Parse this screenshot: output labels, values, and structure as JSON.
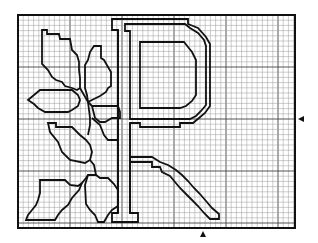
{
  "figure": {
    "type": "cross-stitch-chart",
    "grid": {
      "x": 18,
      "y": 15,
      "width": 277,
      "height": 213,
      "cell": 5.2,
      "color": "#9a9a9a",
      "major_color": "#444444",
      "major_every": 10
    },
    "colors": {
      "line": "#111111",
      "background": "#ffffff"
    },
    "center_markers": {
      "right": {
        "x": 298,
        "y": 119
      },
      "bottom": {
        "x": 203,
        "y": 231
      }
    },
    "letter_p": {
      "outer": "M112,26 L112,19 L188,19 L188,24 L198,28 L206,37 L210,44 L210,106 L205,113 L199,118 L193,123 L180,123 L180,127 L140,127 L140,123 L130,123 L130,213 L138,213 L138,222 L112,222 L112,213 L118,213 L118,30 L112,30 Z",
      "inner_stroke": "M118,30 L118,213 M130,123 L130,213",
      "bowl_outer": "M125,24 L185,24 L190,28 L198,33 L204,40 L206,46 L206,105 L201,111 L196,116 L190,119 L130,119 L130,31 L125,31 Z",
      "bowl_inner": "M140,42 L184,42 L188,47 L192,52 L196,60 L196,95 L192,101 L186,106 L180,108 L140,108 Z"
    },
    "leg_tail": "M130,162 L152,162 L152,167 L160,167 L162,172 L170,176 L175,182 L180,188 L186,194 L192,200 L198,206 L204,213 L210,219 L219,219 L219,214 L212,208 L206,201 L200,194 L194,188 L188,181 L182,175 L176,170 L168,165 L160,162 L152,157 L130,157 Z",
    "leaves": [
      "M42,30 L47,30 L47,34 L59,34 L60,39 L70,39 L72,50 L77,55 L79,62 L79,70 L80,78 L80,88 L77,90 L72,88 L65,86 L62,82 L56,80 L52,77 L48,70 L42,64 Z",
      "M94,46 L101,46 L101,58 L104,60 L108,67 L111,72 L111,86 L108,88 L106,92 L100,96 L96,98 L88,102 L87,95 L85,88 L85,65 L88,60 L90,52 Z",
      "M40,90 L72,90 L78,95 L80,100 L78,106 L72,110 L68,112 L45,112 L38,108 L34,104 L28,100 L34,95 Z",
      "M92,106 L118,106 L120,112 L120,118 L112,118 L105,122 L100,122 L95,118 Z",
      "M48,123 L56,123 L56,127 L72,127 L80,135 L86,140 L90,145 L92,152 L90,160 L85,163 L70,160 L62,152 L58,142 L50,132 Z",
      "M40,180 L65,180 L70,185 L78,186 L82,183 L79,190 L72,198 L68,205 L62,210 L58,215 L55,220 L26,220 L28,215 L32,210 L36,205 L38,200 L40,193 Z",
      "M88,175 L96,175 L100,178 L108,178 L114,184 L118,190 L118,206 L112,210 L108,215 L104,222 L98,222 L95,215 L90,210 L86,204 L85,185 Z"
    ],
    "stems": [
      "M80,88 L84,95 L88,102 L92,106",
      "M88,102 L90,118 L90,125 L88,135",
      "M92,118 L100,125 L104,135 L108,140 L118,140",
      "M90,160 L94,165 L96,175",
      "M82,183 L86,178 L88,175"
    ]
  }
}
